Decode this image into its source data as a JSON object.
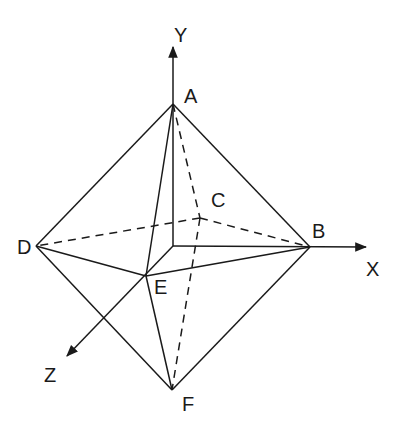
{
  "figure": {
    "type": "octahedron-3d-axes",
    "stroke_color": "#1a1a1a",
    "background": "#ffffff"
  },
  "axes": {
    "x": {
      "label": "X",
      "origin": [
        173,
        246
      ],
      "tip": [
        368,
        247
      ]
    },
    "y": {
      "label": "Y",
      "origin": [
        173,
        246
      ],
      "tip": [
        173,
        45
      ]
    },
    "z": {
      "label": "Z",
      "origin": [
        173,
        246
      ],
      "tip": [
        65,
        358
      ]
    }
  },
  "vertices": {
    "A": {
      "label": "A",
      "pos": [
        173,
        104
      ]
    },
    "B": {
      "label": "B",
      "pos": [
        310,
        247
      ]
    },
    "C": {
      "label": "C",
      "pos": [
        200,
        218
      ]
    },
    "D": {
      "label": "D",
      "pos": [
        36,
        246
      ]
    },
    "E": {
      "label": "E",
      "pos": [
        146,
        276
      ]
    },
    "F": {
      "label": "F",
      "pos": [
        172,
        390
      ]
    }
  },
  "edges": {
    "solid": [
      [
        "A",
        "B"
      ],
      [
        "A",
        "D"
      ],
      [
        "A",
        "E"
      ],
      [
        "B",
        "E"
      ],
      [
        "D",
        "E"
      ],
      [
        "B",
        "F"
      ],
      [
        "D",
        "F"
      ],
      [
        "E",
        "F"
      ]
    ],
    "dashed": [
      [
        "A",
        "C"
      ],
      [
        "C",
        "D"
      ],
      [
        "C",
        "B"
      ],
      [
        "C",
        "F"
      ]
    ]
  }
}
